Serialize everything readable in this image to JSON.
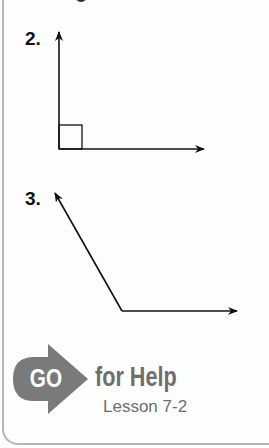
{
  "exercises": [
    {
      "number": "2.",
      "figure": "right-angle"
    },
    {
      "number": "3.",
      "figure": "obtuse-angle"
    }
  ],
  "help": {
    "go_label": "GO",
    "title": "for Help",
    "lesson": "Lesson 7-2"
  },
  "colors": {
    "line": "#111111",
    "help_gray": "#6e6e6e",
    "border": "#b5b5b5"
  }
}
